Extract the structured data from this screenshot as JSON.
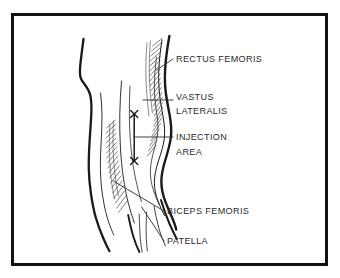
{
  "figure": {
    "kind": "anatomical-diagram",
    "background_color": "#ffffff",
    "ink_color": "#1a1a1a",
    "text_color": "#2a2a2a",
    "hatch_color": "#3d3d3d",
    "frame": {
      "present": true,
      "color": "#111111",
      "stroke_width": 3
    }
  },
  "labels": [
    {
      "id": "rectus-femoris",
      "lines": [
        "RECTUS FEMORIS"
      ],
      "x": 176,
      "y": 62
    },
    {
      "id": "vastus-lateralis",
      "lines": [
        "VASTUS",
        "LATERALIS"
      ],
      "x": 176,
      "y": 103
    },
    {
      "id": "injection-area",
      "lines": [
        "INJECTION",
        "AREA"
      ],
      "x": 176,
      "y": 140
    },
    {
      "id": "biceps-femoris",
      "lines": [
        "BICEPS FEMORIS"
      ],
      "x": 167,
      "y": 214
    },
    {
      "id": "patella",
      "lines": [
        "PATELLA"
      ],
      "x": 167,
      "y": 244
    }
  ],
  "markers": {
    "injection_bracket": {
      "top_mark": "x",
      "bottom_mark": "x",
      "description": "Vertical bracket with x marks delimiting the injection area"
    }
  }
}
